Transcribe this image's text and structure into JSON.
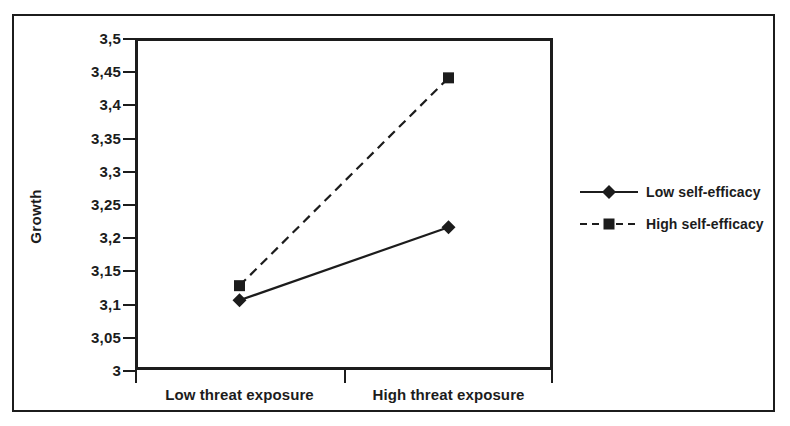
{
  "chart_data": {
    "type": "line",
    "title": "",
    "xlabel": "",
    "ylabel": "Growth",
    "categories": [
      "Low threat exposure",
      "High threat exposure"
    ],
    "ylim": [
      3,
      3.5
    ],
    "ytick_labels": [
      "3",
      "3,05",
      "3,1",
      "3,15",
      "3,2",
      "3,25",
      "3,3",
      "3,35",
      "3,4",
      "3,45",
      "3,5"
    ],
    "ytick_values": [
      3,
      3.05,
      3.1,
      3.15,
      3.2,
      3.25,
      3.3,
      3.35,
      3.4,
      3.45,
      3.5
    ],
    "grid": false,
    "legend_position": "right",
    "decimal_separator": ",",
    "series": [
      {
        "name": "Low self-efficacy",
        "values": [
          3.105,
          3.215
        ],
        "line_style": "solid",
        "marker": "diamond",
        "color": "#1c1c1c"
      },
      {
        "name": "High self-efficacy",
        "values": [
          3.127,
          3.44
        ],
        "line_style": "dashed",
        "marker": "square",
        "color": "#1c1c1c"
      }
    ]
  },
  "legend": {
    "items": [
      {
        "label": "Low self-efficacy",
        "marker": "diamond-marker-icon",
        "line_style": "solid"
      },
      {
        "label": "High self-efficacy",
        "marker": "square-marker-icon",
        "line_style": "dashed"
      }
    ]
  },
  "axes": {
    "y_title": "Growth",
    "x_labels": [
      "Low threat exposure",
      "High threat exposure"
    ],
    "y_labels": [
      "3,5",
      "3,45",
      "3,4",
      "3,35",
      "3,3",
      "3,25",
      "3,2",
      "3,15",
      "3,1",
      "3,05",
      "3"
    ]
  },
  "colors": {
    "ink": "#1c1c1c",
    "background": "#ffffff"
  }
}
